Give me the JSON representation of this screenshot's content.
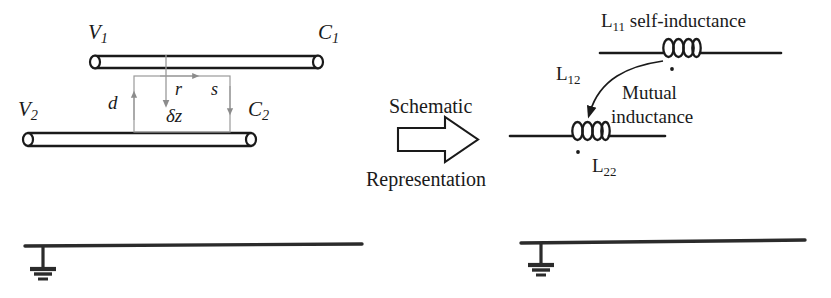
{
  "figure": {
    "type": "circuit-schematic-diagram",
    "background_color": "#ffffff",
    "ink_color": "#1a1a1a",
    "guide_color": "#8c8c8c"
  },
  "left_panel": {
    "name": "coupled-transmission-lines",
    "conductor_top": {
      "start_label": "V",
      "start_sub": "1",
      "end_label": "C",
      "end_sub": "1"
    },
    "conductor_bottom": {
      "start_label": "V",
      "start_sub": "2",
      "end_label": "C",
      "end_sub": "2"
    },
    "loop_annotations": {
      "separation": "d",
      "flux_arrow": "r",
      "side_arrow": "s",
      "segment_length": "δz"
    }
  },
  "transition": {
    "line1": "Schematic",
    "line2": "Representation",
    "arrow": "block-arrow-right"
  },
  "right_panel": {
    "name": "schematic-representation",
    "top_inductor": {
      "caption": "L",
      "caption_sub": "11",
      "caption_rest": " self-inductance",
      "dot": "polarity-dot"
    },
    "bottom_inductor": {
      "label": "L",
      "label_sub": "22",
      "dot": "polarity-dot"
    },
    "coupling": {
      "label": "L",
      "label_sub": "12",
      "note_line1": "Mutual",
      "note_line2": "inductance"
    }
  },
  "ground_rails": [
    {
      "name": "ground-rail-left",
      "symbol": "earth-ground"
    },
    {
      "name": "ground-rail-right",
      "symbol": "earth-ground"
    }
  ]
}
